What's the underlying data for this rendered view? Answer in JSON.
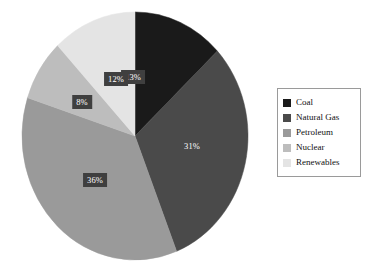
{
  "chart_data": {
    "type": "pie",
    "title": "",
    "xlabel": "",
    "ylabel": "",
    "categories": [
      "Coal",
      "Natural Gas",
      "Petroleum",
      "Nuclear",
      "Renewables"
    ],
    "values": [
      13,
      31,
      36,
      8,
      12
    ],
    "value_unit": "%",
    "data_labels": [
      "13%",
      "31%",
      "36%",
      "8%",
      "12%"
    ],
    "colors": [
      "#1a1a1a",
      "#4a4a4a",
      "#9a9a9a",
      "#bdbdbd",
      "#e4e4e4"
    ],
    "start_angle_deg": 0,
    "direction": "clockwise",
    "grid": false,
    "legend": {
      "position": "right",
      "border_color": "#9a9a9a",
      "entries": [
        {
          "label": "Coal",
          "color": "#1a1a1a"
        },
        {
          "label": "Natural Gas",
          "color": "#4a4a4a"
        },
        {
          "label": "Petroleum",
          "color": "#9a9a9a"
        },
        {
          "label": "Nuclear",
          "color": "#bdbdbd"
        },
        {
          "label": "Renewables",
          "color": "#e4e4e4"
        }
      ]
    },
    "label_style": {
      "box_color": "#3f3f3f",
      "text_color": "#ffffff",
      "boxed": [
        true,
        false,
        true,
        true,
        true
      ]
    }
  },
  "slices": [
    {
      "name": "Coal",
      "label": "13%",
      "color": "#1a1a1a",
      "boxed": true,
      "lx": 133,
      "ly": 77
    },
    {
      "name": "Natural Gas",
      "label": "31%",
      "color": "#4a4a4a",
      "boxed": false,
      "lx": 192,
      "ly": 146
    },
    {
      "name": "Petroleum",
      "label": "36%",
      "color": "#9a9a9a",
      "boxed": true,
      "lx": 95,
      "ly": 180
    },
    {
      "name": "Nuclear",
      "label": "8%",
      "color": "#bdbdbd",
      "boxed": true,
      "lx": 82,
      "ly": 102
    },
    {
      "name": "Renewables",
      "label": "12%",
      "color": "#e4e4e4",
      "boxed": true,
      "lx": 116,
      "ly": 79
    }
  ]
}
